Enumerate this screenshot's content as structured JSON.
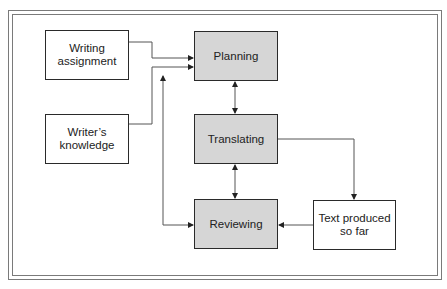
{
  "diagram": {
    "type": "flowchart",
    "title": "",
    "colors": {
      "process_fill": "#d6d6d6",
      "input_fill": "#ffffff",
      "stroke": "#2a2a2a",
      "frame": "#7a7a7a"
    },
    "inputs": [
      {
        "id": "writing-assignment",
        "label": "Writing assignment",
        "lines": [
          "Writing",
          "assignment"
        ]
      },
      {
        "id": "writers-knowledge",
        "label": "Writer’s knowledge",
        "lines": [
          "Writer’s",
          "knowledge"
        ]
      }
    ],
    "processes": [
      {
        "id": "planning",
        "label": "Planning"
      },
      {
        "id": "translating",
        "label": "Translating"
      },
      {
        "id": "reviewing",
        "label": "Reviewing"
      }
    ],
    "outputs": [
      {
        "id": "text-produced",
        "label": "Text produced so far",
        "lines": [
          "Text produced",
          "so far"
        ]
      }
    ],
    "edges": [
      {
        "from": "writing-assignment",
        "to": "planning",
        "type": "arrow"
      },
      {
        "from": "writers-knowledge",
        "to": "planning",
        "type": "arrow"
      },
      {
        "from": "planning",
        "to": "translating",
        "type": "bidirectional"
      },
      {
        "from": "translating",
        "to": "reviewing",
        "type": "bidirectional"
      },
      {
        "from": "reviewing",
        "to": "planning",
        "type": "arrow"
      },
      {
        "from": "translating",
        "to": "text-produced",
        "type": "arrow"
      },
      {
        "from": "text-produced",
        "to": "reviewing",
        "type": "arrow"
      }
    ]
  }
}
